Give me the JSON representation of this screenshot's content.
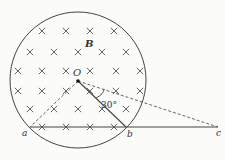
{
  "diagram": {
    "type": "physics-magnetic-field-circle",
    "labels": {
      "field": "B",
      "center": "O",
      "point_a": "a",
      "point_b": "b",
      "point_c": "c",
      "angle": "30°"
    },
    "field_symbol": "×",
    "geometry": {
      "circle": {
        "cx": 78,
        "cy": 80,
        "r": 68
      },
      "O": {
        "x": 78,
        "y": 81
      },
      "a": {
        "x": 30,
        "y": 127
      },
      "b": {
        "x": 126,
        "y": 127
      },
      "c": {
        "x": 218,
        "y": 127
      },
      "dashed_exit": {
        "x": 145,
        "y": 101
      }
    },
    "x_marks": [
      [
        42,
        31
      ],
      [
        66,
        31
      ],
      [
        90,
        31
      ],
      [
        114,
        31
      ],
      [
        30,
        52
      ],
      [
        54,
        52
      ],
      [
        78,
        52
      ],
      [
        102,
        52
      ],
      [
        126,
        52
      ],
      [
        18,
        71
      ],
      [
        42,
        71
      ],
      [
        66,
        71
      ],
      [
        90,
        71
      ],
      [
        116,
        71
      ],
      [
        140,
        71
      ],
      [
        18,
        91
      ],
      [
        42,
        91
      ],
      [
        66,
        91
      ],
      [
        90,
        91
      ],
      [
        116,
        91
      ],
      [
        140,
        91
      ],
      [
        30,
        109
      ],
      [
        54,
        109
      ],
      [
        78,
        109
      ],
      [
        102,
        109
      ],
      [
        126,
        109
      ],
      [
        42,
        127
      ],
      [
        66,
        127
      ],
      [
        90,
        127
      ],
      [
        114,
        127
      ]
    ]
  }
}
